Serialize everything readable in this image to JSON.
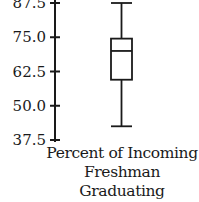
{
  "chart_data": {
    "type": "boxplot",
    "title": "",
    "xlabel": "Percent of Incoming Freshman Graduating in 4 Years",
    "xlabel_lines": [
      "Percent of Incoming",
      "Freshman Graduating",
      "in 4 Years"
    ],
    "ylabel": "",
    "ylim": [
      37.5,
      87.5
    ],
    "yticks": [
      87.5,
      75.0,
      62.5,
      50.0,
      37.5
    ],
    "ytick_labels": [
      "87.5",
      "75.0",
      "62.5",
      "50.0",
      "37.5"
    ],
    "grid": false,
    "series": [
      {
        "name": "Percent of Incoming Freshman Graduating in 4 Years",
        "min": 42.5,
        "q1": 59.5,
        "median": 70,
        "q3": 74.5,
        "max": 87.5
      }
    ]
  },
  "colors": {
    "ink": "#1a1a1a",
    "background": "#ffffff"
  }
}
